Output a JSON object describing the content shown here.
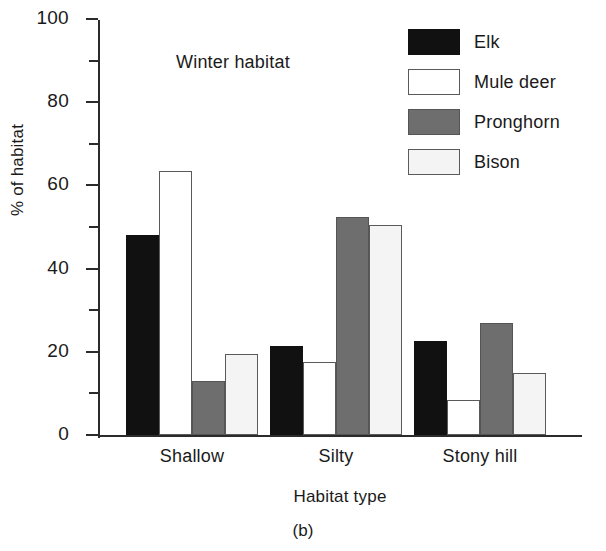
{
  "chart_data": {
    "type": "bar",
    "title": "",
    "annotation": "Winter habitat",
    "caption": "(b)",
    "xlabel": "Habitat type",
    "ylabel": "% of habitat",
    "categories": [
      "Shallow",
      "Silty",
      "Stony hill"
    ],
    "ylim": [
      0,
      100
    ],
    "ytick_major": [
      0,
      20,
      40,
      60,
      80,
      100
    ],
    "ytick_minor": [
      10,
      30,
      50,
      70,
      90
    ],
    "ytick_labels": [
      "0",
      "20",
      "40",
      "60",
      "80",
      "100"
    ],
    "grid": false,
    "legend_position": "top-right",
    "series": [
      {
        "name": "Elk",
        "color": "#111111",
        "edge": "#111111",
        "values": [
          48,
          21.5,
          22.5
        ]
      },
      {
        "name": "Mule deer",
        "color": "#ffffff",
        "edge": "#5a5a5a",
        "values": [
          63.5,
          17.5,
          8.5
        ]
      },
      {
        "name": "Pronghorn",
        "color": "#6e6e6e",
        "edge": "#555555",
        "values": [
          13,
          52.5,
          27
        ]
      },
      {
        "name": "Bison",
        "color": "#f4f4f4",
        "edge": "#5a5a5a",
        "values": [
          19.5,
          50.5,
          15
        ]
      }
    ]
  }
}
